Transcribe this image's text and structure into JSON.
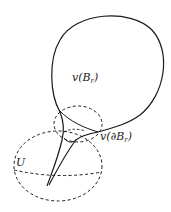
{
  "diagram": {
    "type": "topological-illustration",
    "colors": {
      "stroke": "#1a1a1a",
      "background": "#ffffff"
    },
    "labels": {
      "image": {
        "prefix": "v(B",
        "sub": "r",
        "suffix": ")"
      },
      "boundary": {
        "prefix": "v(∂B",
        "sub": "r",
        "suffix": ")"
      },
      "neighborhood": {
        "text": "U"
      }
    },
    "shapes": [
      {
        "name": "bubble-curve",
        "style": "solid",
        "description": "Image of the ball v(B_r), a rounded bubble attached via a thin neck"
      },
      {
        "name": "neck-curve",
        "style": "solid",
        "description": "Thin cusp-like tail converging to a point inside U"
      },
      {
        "name": "upper-dashed-ellipse",
        "style": "dashed"
      },
      {
        "name": "lower-dashed-ellipse",
        "style": "dashed",
        "description": "Neighborhood U"
      },
      {
        "name": "equator-dashed-line",
        "style": "dashed"
      }
    ]
  }
}
